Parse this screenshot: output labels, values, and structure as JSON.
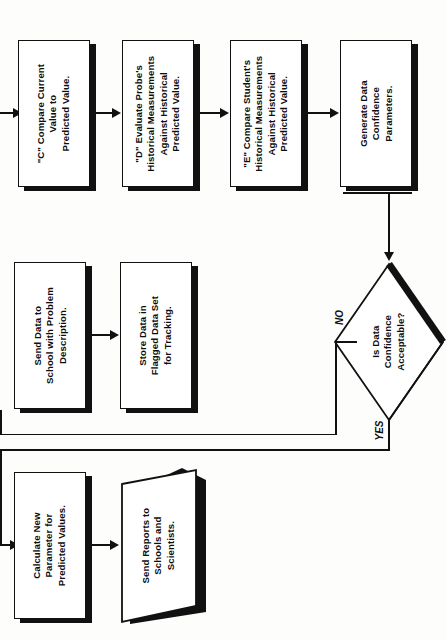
{
  "diagram": {
    "orientation": "rotated-90-ccw",
    "colors": {
      "line": "#111111",
      "shadow": "#111111",
      "fill": "#ffffff",
      "text": "#0d0d0d"
    },
    "nodes": [
      {
        "id": "compare-current-value",
        "shape": "process",
        "text": "\"C\" Compare Current\nValue to\nPredicted Value."
      },
      {
        "id": "evaluate-probe-historical",
        "shape": "process",
        "text": "\"D\" Evaluate Probe's\nHistorical Measurements\nAgainst Historical\nPredicted Value."
      },
      {
        "id": "compare-student-historical",
        "shape": "process",
        "text": "\"E\" Compare Student's\nHistorical Measurements\nAgainst Historical\nPredicted Value."
      },
      {
        "id": "generate-confidence-parameters",
        "shape": "process",
        "text": "Generate Data\nConfidence\nParameters."
      },
      {
        "id": "is-data-confidence-acceptable",
        "shape": "decision",
        "text": "Is Data\nConfidence\nAcceptable?"
      },
      {
        "id": "send-data-to-school",
        "shape": "process",
        "text": "Send Data to\nSchool with Problem\nDescription."
      },
      {
        "id": "store-data-flagged",
        "shape": "process",
        "text": "Store Data in\nFlagged Data Set\nfor Tracking."
      },
      {
        "id": "calculate-new-parameter",
        "shape": "process",
        "text": "Calculate New\nParameter for\nPredicted Values."
      },
      {
        "id": "send-reports",
        "shape": "data-output",
        "text": "Send Reports to\nSchools and\nScientists."
      }
    ],
    "branch_labels": {
      "no": "NO",
      "yes": "YES"
    },
    "edge_note": ""
  }
}
